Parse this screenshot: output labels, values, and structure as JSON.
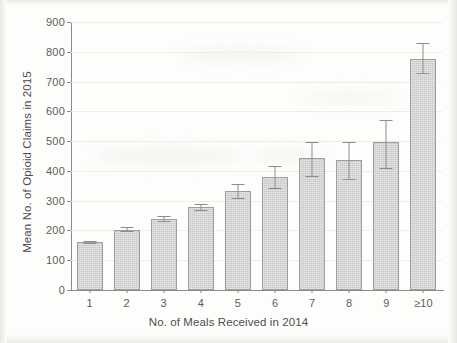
{
  "chart_data": {
    "type": "bar",
    "title": "",
    "xlabel": "No. of Meals Received in 2014",
    "ylabel": "Mean No. of Opioid Claims in 2015",
    "categories": [
      "1",
      "2",
      "3",
      "4",
      "5",
      "6",
      "7",
      "8",
      "9",
      "≥10"
    ],
    "values": [
      162,
      203,
      240,
      278,
      333,
      380,
      443,
      438,
      498,
      775
    ],
    "error_low": [
      158,
      197,
      232,
      267,
      310,
      343,
      384,
      372,
      409,
      728
    ],
    "error_high": [
      166,
      210,
      248,
      289,
      356,
      418,
      496,
      497,
      571,
      829
    ],
    "ylim": [
      0,
      900
    ],
    "yticks": [
      0,
      100,
      200,
      300,
      400,
      500,
      600,
      700,
      800,
      900
    ],
    "ytick_labels": [
      "0",
      "100",
      "200",
      "300",
      "400",
      "500",
      "600",
      "700",
      "800",
      "900"
    ],
    "grid": true,
    "legend": null,
    "bar_color": "#cdcdcb",
    "bar_edge_color": "#9e9e9c",
    "error_color": "#8d8d8b",
    "axis_color": "#8a8a88",
    "grid_color": "#eeedea",
    "background": "#fdfdfc"
  }
}
